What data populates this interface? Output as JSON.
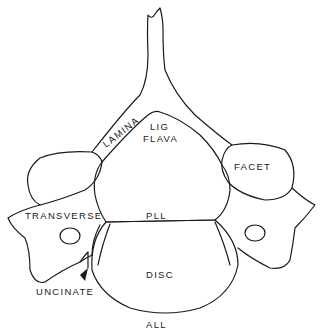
{
  "diagram": {
    "type": "anatomical-cross-section",
    "labels": {
      "lamina": "LAMINA",
      "lig_flava_line1": "LIG",
      "lig_flava_line2": "FLAVA",
      "facet": "FACET",
      "transverse": "TRANSVERSE",
      "pll": "PLL",
      "disc": "DISC",
      "uncinate": "UNCINATE",
      "all": "ALL"
    },
    "colors": {
      "line": "#1a1a1a",
      "background": "#ffffff"
    }
  }
}
